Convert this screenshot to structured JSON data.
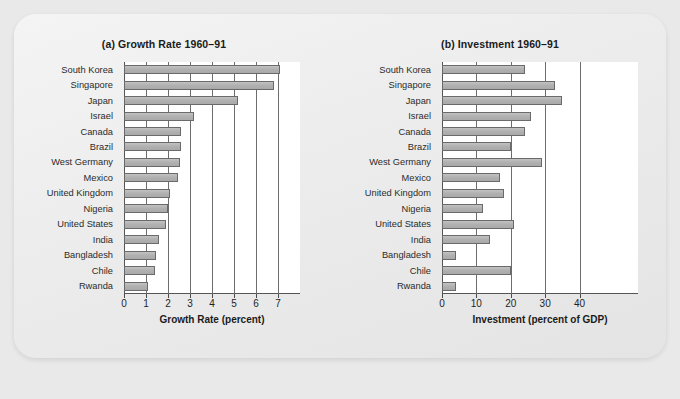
{
  "chart_data": [
    {
      "type": "bar",
      "orientation": "horizontal",
      "title": "(a) Growth Rate 1960–91",
      "xlabel": "Growth Rate (percent)",
      "ylabel": "",
      "categories": [
        "South Korea",
        "Singapore",
        "Japan",
        "Israel",
        "Canada",
        "Brazil",
        "West Germany",
        "Mexico",
        "United Kingdom",
        "Nigeria",
        "United States",
        "India",
        "Bangladesh",
        "Chile",
        "Rwanda"
      ],
      "values": [
        7.1,
        6.8,
        5.2,
        3.2,
        2.6,
        2.6,
        2.55,
        2.45,
        2.1,
        2.0,
        1.9,
        1.6,
        1.45,
        1.4,
        1.1
      ],
      "xlim": [
        0,
        8.0
      ],
      "xticks": [
        0,
        1,
        2,
        3,
        4,
        5,
        6,
        7
      ],
      "xticklabels": [
        "0",
        "1",
        "2",
        "3",
        "4",
        "5",
        "6",
        "7"
      ],
      "grid": "vertical",
      "legend": "none",
      "bar_fill": "#b5b5b5",
      "bar_stroke": "#6a6a6a"
    },
    {
      "type": "bar",
      "orientation": "horizontal",
      "title": "(b) Investment 1960–91",
      "xlabel": "Investment (percent of GDP)",
      "ylabel": "",
      "categories": [
        "South Korea",
        "Singapore",
        "Japan",
        "Israel",
        "Canada",
        "Brazil",
        "West Germany",
        "Mexico",
        "United Kingdom",
        "Nigeria",
        "United States",
        "India",
        "Bangladesh",
        "Chile",
        "Rwanda"
      ],
      "values": [
        24,
        33,
        35,
        26,
        24,
        20,
        29,
        17,
        18,
        12,
        21,
        14,
        4,
        20,
        4
      ],
      "xlim": [
        0,
        57
      ],
      "xticks": [
        0,
        10,
        20,
        30,
        40
      ],
      "xticklabels": [
        "0",
        "10",
        "20",
        "30",
        "40"
      ],
      "grid": "vertical",
      "legend": "none",
      "bar_fill": "#b5b5b5",
      "bar_stroke": "#6a6a6a"
    }
  ],
  "figure": {
    "background": "#e9e9e9",
    "page_background": "#f0f0f0"
  }
}
